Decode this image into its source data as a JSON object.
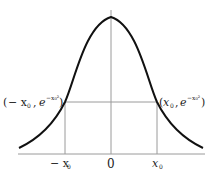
{
  "diagram": {
    "type": "gaussian-curve",
    "function": "y = e^{-x^2}",
    "labels": {
      "left_point": "(− x₀ , e⁻ˣ₀²)",
      "right_point": "(x₀ , e⁻ˣ₀²)",
      "left_point_x": "− x",
      "left_point_x_sub": "0",
      "right_point_x": "x",
      "right_point_x_sub": "0",
      "left_point_e": "e",
      "right_point_e": "e",
      "left_point_exp": "−x₀²",
      "right_point_exp": "−x₀²",
      "tick_neg_x0": "− x",
      "tick_neg_x0_sub": "0",
      "tick_origin": "0",
      "tick_pos_x0": "x",
      "tick_pos_x0_sub": "0"
    },
    "colors": {
      "curve": "#111111",
      "axes": "#9a9a9a",
      "guides": "#9a9a9a",
      "text": "#222222"
    }
  }
}
